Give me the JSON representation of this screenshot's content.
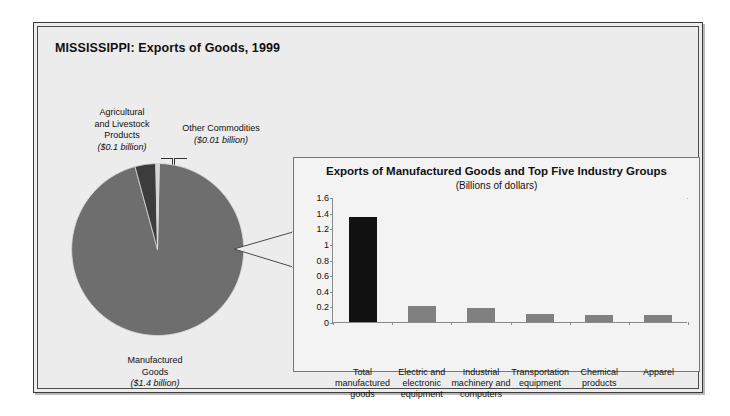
{
  "figure": {
    "title": "MISSISSIPPI: Exports of Goods, 1999"
  },
  "pie": {
    "labels": {
      "agricultural": {
        "name_line1": "Agricultural",
        "name_line2": "and Livestock",
        "name_line3": "Products",
        "amount": "($0.1 billion)"
      },
      "other": {
        "name_line1": "Other Commodities",
        "amount": "($0.01 billion)"
      },
      "manufactured": {
        "name_line1": "Manufactured",
        "name_line2": "Goods",
        "amount": "($1.4 billion)"
      }
    }
  },
  "colors": {
    "manufactured_wedge": "#6e6e6e",
    "agricultural_wedge": "#3c3c3c",
    "other_wedge": "#d4d4d4",
    "total_bar": "#111111",
    "industry_bar": "#808080",
    "panel_background": "#f3f3f3",
    "figure_background": "#ececec",
    "axis": "#8a8a8a"
  },
  "chart_data": [
    {
      "type": "pie",
      "title": "MISSISSIPPI: Exports of Goods, 1999",
      "unit": "billions of dollars",
      "categories": [
        "Manufactured Goods",
        "Agricultural and Livestock Products",
        "Other Commodities"
      ],
      "values": [
        1.4,
        0.1,
        0.01
      ],
      "value_labels": [
        "($1.4 billion)",
        "($0.1 billion)",
        "($0.01 billion)"
      ],
      "colors": [
        "#6e6e6e",
        "#3c3c3c",
        "#d4d4d4"
      ],
      "legend": "none",
      "labels_position": "outside-with-leader-lines"
    },
    {
      "type": "bar",
      "title": "Exports of Manufactured Goods and Top Five Industry Groups",
      "subtitle": "(Billions of dollars)",
      "xlabel": "",
      "ylabel": "",
      "ylim": [
        0,
        1.6
      ],
      "yticks": [
        0,
        0.2,
        0.4,
        0.6,
        0.8,
        1,
        1.2,
        1.4,
        1.6
      ],
      "ytick_labels": [
        "0",
        "0.2",
        "0.4",
        "0.6",
        "0.8",
        "1",
        "1.2",
        "1.4",
        "1.6"
      ],
      "grid": false,
      "categories": [
        "Total manufactured goods",
        "Electric and electronic equipment",
        "Industrial machinery and computers",
        "Transportation equipment",
        "Chemical products",
        "Apparel"
      ],
      "category_label_lines": [
        [
          "Total",
          "manufactured",
          "goods"
        ],
        [
          "Electric and",
          "electronic",
          "equipment"
        ],
        [
          "Industrial",
          "machinery and",
          "computers"
        ],
        [
          "Transportation",
          "equipment"
        ],
        [
          "Chemical",
          "products"
        ],
        [
          "Apparel"
        ]
      ],
      "values": [
        1.35,
        0.2,
        0.18,
        0.1,
        0.09,
        0.09
      ],
      "bar_colors": [
        "#111111",
        "#808080",
        "#808080",
        "#808080",
        "#808080",
        "#808080"
      ]
    }
  ]
}
